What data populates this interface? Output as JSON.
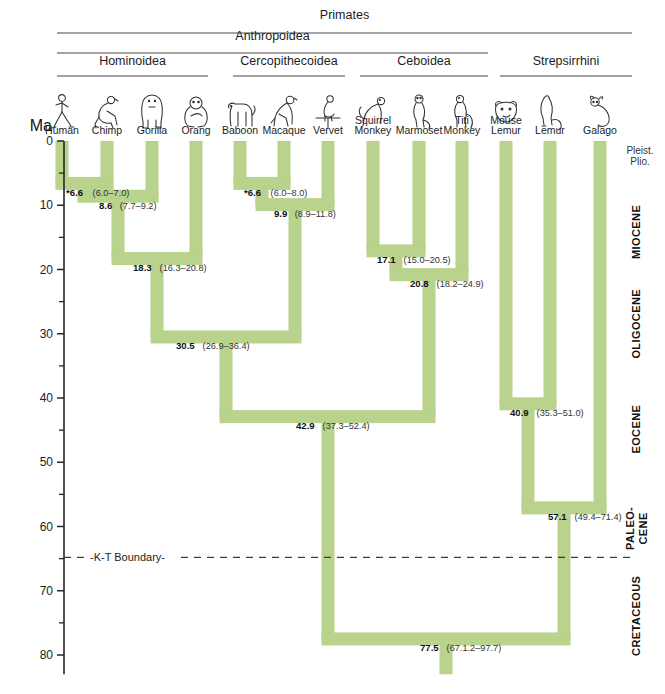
{
  "figure": {
    "axis_title": "Ma",
    "kt_boundary_label": "-K-T Boundary-",
    "kt_boundary_ma": 64.8,
    "accent_branch_color": "#b9d28c",
    "axis_color": "#262626"
  },
  "clades": [
    {
      "name": "Primates",
      "label": "Primates",
      "x1": 57,
      "x2": 632,
      "rule_y": 33,
      "text_y": 19
    },
    {
      "name": "Anthropoidea",
      "label": "Anthropoidea",
      "x1": 57,
      "x2": 488,
      "rule_y": 53,
      "text_y": 40
    },
    {
      "name": "Hominoidea",
      "label": "Hominoidea",
      "x1": 57,
      "x2": 208,
      "rule_y": 76,
      "text_y": 65
    },
    {
      "name": "Cercopithecoidea",
      "label": "Cercopithecoidea",
      "x1": 233,
      "x2": 345,
      "rule_y": 76,
      "text_y": 65
    },
    {
      "name": "Ceboidea",
      "label": "Ceboidea",
      "x1": 360,
      "x2": 488,
      "rule_y": 76,
      "text_y": 65
    },
    {
      "name": "Strepsirrhini",
      "label": "Strepsirrhini",
      "x1": 500,
      "x2": 632,
      "rule_y": 76,
      "text_y": 65
    }
  ],
  "taxa": [
    {
      "name": "human",
      "label": "Human",
      "label2": "",
      "x": 62,
      "icon": "human"
    },
    {
      "name": "chimp",
      "label": "Chimp",
      "label2": "",
      "x": 107,
      "icon": "chimp"
    },
    {
      "name": "gorilla",
      "label": "Gorilla",
      "label2": "",
      "x": 152,
      "icon": "gorilla"
    },
    {
      "name": "orang",
      "label": "Orang",
      "label2": "",
      "x": 196,
      "icon": "orang"
    },
    {
      "name": "baboon",
      "label": "Baboon",
      "label2": "",
      "x": 240,
      "icon": "baboon"
    },
    {
      "name": "macaque",
      "label": "Macaque",
      "label2": "",
      "x": 284,
      "icon": "macaque"
    },
    {
      "name": "vervet",
      "label": "Vervet",
      "label2": "",
      "x": 328,
      "icon": "vervet"
    },
    {
      "name": "squirrel-monkey",
      "label": "Squirrel",
      "label2": "Monkey",
      "x": 373,
      "icon": "squirrel-monkey"
    },
    {
      "name": "marmoset",
      "label": "Marmoset",
      "label2": "",
      "x": 419,
      "icon": "marmoset"
    },
    {
      "name": "titi-monkey",
      "label": "Titi",
      "label2": "Monkey",
      "x": 462,
      "icon": "titi-monkey"
    },
    {
      "name": "mouse-lemur",
      "label": "Mouse",
      "label2": "Lemur",
      "x": 506,
      "icon": "mouse-lemur"
    },
    {
      "name": "lemur",
      "label": "Lemur",
      "label2": "",
      "x": 550,
      "icon": "lemur"
    },
    {
      "name": "galago",
      "label": "Galago",
      "label2": "",
      "x": 600,
      "icon": "galago"
    }
  ],
  "axis": {
    "ticks_major": [
      {
        "value": 0,
        "label": "0"
      },
      {
        "value": 10,
        "label": "10"
      },
      {
        "value": 20,
        "label": "20"
      },
      {
        "value": 30,
        "label": "30"
      },
      {
        "value": 40,
        "label": "40"
      },
      {
        "value": 50,
        "label": "50"
      },
      {
        "value": 60,
        "label": "60"
      },
      {
        "value": 70,
        "label": "70"
      },
      {
        "value": 80,
        "label": "80"
      }
    ],
    "ticks_minor": [
      5,
      15,
      25,
      35,
      45,
      55,
      65,
      75
    ],
    "min": 0,
    "max": 83
  },
  "epochs": [
    {
      "name": "pleistocene-pliocene",
      "label": "Pleist.",
      "label2": "Plio.",
      "from": 0,
      "to": 5.3,
      "rotated": false
    },
    {
      "name": "miocene",
      "label": "MIOCENE",
      "label2": "",
      "from": 5.3,
      "to": 23.0,
      "rotated": true
    },
    {
      "name": "oligocene",
      "label": "OLIGOCENE",
      "label2": "",
      "from": 23.0,
      "to": 33.9,
      "rotated": true
    },
    {
      "name": "eocene",
      "label": "EOCENE",
      "label2": "",
      "from": 33.9,
      "to": 55.8,
      "rotated": true
    },
    {
      "name": "paleocene",
      "label": "PALEO-",
      "label2": "CENE",
      "from": 55.8,
      "to": 64.8,
      "rotated": true
    },
    {
      "name": "cretaceous",
      "label": "CRETACEOUS",
      "label2": "",
      "from": 64.8,
      "to": 83.0,
      "rotated": true
    }
  ],
  "chart_data": {
    "type": "tree",
    "ylabel": "Ma",
    "ylim": [
      0,
      83
    ],
    "nodes": [
      {
        "name": "human-chimp",
        "age": "*6.6",
        "ci": "(6.0–7.0)",
        "age_ma": 6.6,
        "x1": 62,
        "x2": 107,
        "label_x": 66,
        "label_anchor": "start"
      },
      {
        "name": "hominines",
        "age": "8.6",
        "ci": "(7.7–9.2)",
        "age_ma": 8.6,
        "x1": 84,
        "x2": 152,
        "label_x": 99,
        "label_anchor": "start"
      },
      {
        "name": "great-apes",
        "age": "18.3",
        "ci": "(16.3–20.8)",
        "age_ma": 18.3,
        "x1": 118,
        "x2": 196,
        "label_x": 133,
        "label_anchor": "start"
      },
      {
        "name": "baboon-macaque",
        "age": "*6.6",
        "ci": "(6.0–8.0)",
        "age_ma": 6.6,
        "x1": 240,
        "x2": 284,
        "label_x": 244,
        "label_anchor": "start"
      },
      {
        "name": "cercopithecines",
        "age": "9.9",
        "ci": "(8.9–11.8)",
        "age_ma": 9.9,
        "x1": 262,
        "x2": 328,
        "label_x": 274,
        "label_anchor": "start"
      },
      {
        "name": "squirrel-marmoset",
        "age": "17.1",
        "ci": "(15.0–20.5)",
        "age_ma": 17.1,
        "x1": 373,
        "x2": 419,
        "label_x": 377,
        "label_anchor": "start"
      },
      {
        "name": "ceboids",
        "age": "20.8",
        "ci": "(18.2–24.9)",
        "age_ma": 20.8,
        "x1": 396,
        "x2": 462,
        "label_x": 410,
        "label_anchor": "start"
      },
      {
        "name": "catarrhines",
        "age": "30.5",
        "ci": "(26.9–36.4)",
        "age_ma": 30.5,
        "x1": 157,
        "x2": 295,
        "label_x": 176,
        "label_anchor": "start"
      },
      {
        "name": "anthropoids",
        "age": "42.9",
        "ci": "(37.3–52.4)",
        "age_ma": 42.9,
        "x1": 226,
        "x2": 429,
        "label_x": 296,
        "label_anchor": "start"
      },
      {
        "name": "mouse-lemur-lemur",
        "age": "40.9",
        "ci": "(35.3–51.0)",
        "age_ma": 40.9,
        "x1": 506,
        "x2": 550,
        "label_x": 510,
        "label_anchor": "start"
      },
      {
        "name": "strepsirrhines",
        "age": "57.1",
        "ci": "(49.4–71.4)",
        "age_ma": 57.1,
        "x1": 528,
        "x2": 600,
        "label_x": 548,
        "label_anchor": "start"
      },
      {
        "name": "primates-root",
        "age": "77.5",
        "ci": "(67.1.2–97.7)",
        "age_ma": 77.5,
        "x1": 328,
        "x2": 564,
        "label_x": 420,
        "label_anchor": "start"
      }
    ],
    "terminals": [
      {
        "name": "human",
        "x": 62,
        "from": 0,
        "to": 6.6
      },
      {
        "name": "chimp",
        "x": 107,
        "from": 0,
        "to": 6.6
      },
      {
        "name": "gorilla",
        "x": 152,
        "from": 0,
        "to": 8.6
      },
      {
        "name": "orang",
        "x": 196,
        "from": 0,
        "to": 18.3
      },
      {
        "name": "baboon",
        "x": 240,
        "from": 0,
        "to": 6.6
      },
      {
        "name": "macaque",
        "x": 284,
        "from": 0,
        "to": 6.6
      },
      {
        "name": "vervet",
        "x": 328,
        "from": 0,
        "to": 9.9
      },
      {
        "name": "squirrel-monkey",
        "x": 373,
        "from": 0,
        "to": 17.1
      },
      {
        "name": "marmoset",
        "x": 419,
        "from": 0,
        "to": 17.1
      },
      {
        "name": "titi-monkey",
        "x": 462,
        "from": 0,
        "to": 20.8
      },
      {
        "name": "mouse-lemur",
        "x": 506,
        "from": 0,
        "to": 40.9
      },
      {
        "name": "lemur",
        "x": 550,
        "from": 0,
        "to": 40.9
      },
      {
        "name": "galago",
        "x": 600,
        "from": 0,
        "to": 57.1
      }
    ],
    "connectors": [
      {
        "name": "human-chimp-to-hominines",
        "x": 84,
        "from": 6.6,
        "to": 8.6
      },
      {
        "name": "hominines-to-great-apes",
        "x": 118,
        "from": 8.6,
        "to": 18.3
      },
      {
        "name": "great-apes-to-catarrhines",
        "x": 157,
        "from": 18.3,
        "to": 30.5
      },
      {
        "name": "baboon-macaque-to-cerco",
        "x": 262,
        "from": 6.6,
        "to": 9.9
      },
      {
        "name": "cerco-to-catarrhines",
        "x": 295,
        "from": 9.9,
        "to": 30.5
      },
      {
        "name": "catarrhines-to-anthropoids",
        "x": 226,
        "from": 30.5,
        "to": 42.9
      },
      {
        "name": "squirrel-marmoset-to-ceboid",
        "x": 396,
        "from": 17.1,
        "to": 20.8
      },
      {
        "name": "ceboids-to-anthropoids",
        "x": 429,
        "from": 20.8,
        "to": 42.9
      },
      {
        "name": "anthropoids-to-root",
        "x": 328,
        "from": 42.9,
        "to": 77.5
      },
      {
        "name": "lemurs-to-strepsirrhines",
        "x": 528,
        "from": 40.9,
        "to": 57.1
      },
      {
        "name": "strepsirrhines-to-root",
        "x": 564,
        "from": 57.1,
        "to": 77.5
      },
      {
        "name": "root-stem",
        "x": 446,
        "from": 77.5,
        "to": 83.0
      }
    ]
  }
}
